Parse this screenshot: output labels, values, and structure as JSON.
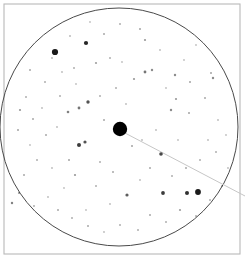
{
  "chart_data": {
    "type": "scatter",
    "title": "",
    "subtitle": "",
    "xlabel": "",
    "ylabel": "",
    "grid": false,
    "legend": "none",
    "xlim": [
      0,
      245
    ],
    "ylim": [
      0,
      258
    ],
    "frame": {
      "x": 4,
      "y": 4,
      "width": 236,
      "height": 250,
      "stroke": "#b9b9b9",
      "stroke_width": 1.1,
      "fill": "#ffffff"
    },
    "field_circle": {
      "label": "field-of-view circle",
      "cx": 119,
      "cy": 127,
      "r": 119,
      "stroke": "#4a4a4a",
      "stroke_width": 1.0,
      "fill": "none"
    },
    "target_marker": {
      "label": "target object",
      "cx": 120,
      "cy": 129,
      "r": 7.2,
      "fill": "#000000"
    },
    "pointer_line": {
      "label": "offset pointer",
      "x1": 125,
      "y1": 133,
      "x2": 245,
      "y2": 196,
      "stroke": "#c6c6c6",
      "stroke_width": 1.0
    },
    "star_color": "#1a1a1a",
    "stars": [
      {
        "x": 55,
        "y": 52,
        "r": 3.1,
        "o": 1.0
      },
      {
        "x": 86,
        "y": 43,
        "r": 2.1,
        "o": 0.95
      },
      {
        "x": 198,
        "y": 192,
        "r": 2.9,
        "o": 1.0
      },
      {
        "x": 187,
        "y": 193,
        "r": 2.0,
        "o": 0.9
      },
      {
        "x": 163,
        "y": 193,
        "r": 1.9,
        "o": 0.85
      },
      {
        "x": 79,
        "y": 145,
        "r": 2.0,
        "o": 0.85
      },
      {
        "x": 85,
        "y": 142,
        "r": 1.6,
        "o": 0.75
      },
      {
        "x": 161,
        "y": 154,
        "r": 1.8,
        "o": 0.8
      },
      {
        "x": 127,
        "y": 195,
        "r": 1.6,
        "o": 0.7
      },
      {
        "x": 88,
        "y": 102,
        "r": 1.7,
        "o": 0.75
      },
      {
        "x": 79,
        "y": 108,
        "r": 1.4,
        "o": 0.6
      },
      {
        "x": 68,
        "y": 112,
        "r": 1.3,
        "o": 0.55
      },
      {
        "x": 145,
        "y": 72,
        "r": 1.4,
        "o": 0.6
      },
      {
        "x": 152,
        "y": 70,
        "r": 1.2,
        "o": 0.5
      },
      {
        "x": 134,
        "y": 79,
        "r": 1.1,
        "o": 0.45
      },
      {
        "x": 175,
        "y": 75,
        "r": 1.2,
        "o": 0.5
      },
      {
        "x": 190,
        "y": 82,
        "r": 1.0,
        "o": 0.4
      },
      {
        "x": 176,
        "y": 99,
        "r": 1.1,
        "o": 0.45
      },
      {
        "x": 171,
        "y": 110,
        "r": 1.2,
        "o": 0.5
      },
      {
        "x": 189,
        "y": 113,
        "r": 1.0,
        "o": 0.4
      },
      {
        "x": 205,
        "y": 98,
        "r": 1.0,
        "o": 0.38
      },
      {
        "x": 213,
        "y": 78,
        "r": 1.2,
        "o": 0.5
      },
      {
        "x": 211,
        "y": 73,
        "r": 1.0,
        "o": 0.4
      },
      {
        "x": 145,
        "y": 40,
        "r": 1.1,
        "o": 0.45
      },
      {
        "x": 140,
        "y": 29,
        "r": 1.0,
        "o": 0.4
      },
      {
        "x": 120,
        "y": 24,
        "r": 1.0,
        "o": 0.35
      },
      {
        "x": 104,
        "y": 34,
        "r": 1.0,
        "o": 0.38
      },
      {
        "x": 96,
        "y": 63,
        "r": 1.1,
        "o": 0.42
      },
      {
        "x": 110,
        "y": 58,
        "r": 1.0,
        "o": 0.35
      },
      {
        "x": 74,
        "y": 68,
        "r": 1.0,
        "o": 0.35
      },
      {
        "x": 62,
        "y": 72,
        "r": 0.9,
        "o": 0.3
      },
      {
        "x": 45,
        "y": 82,
        "r": 1.0,
        "o": 0.35
      },
      {
        "x": 30,
        "y": 70,
        "r": 1.0,
        "o": 0.38
      },
      {
        "x": 26,
        "y": 97,
        "r": 1.0,
        "o": 0.35
      },
      {
        "x": 20,
        "y": 110,
        "r": 1.1,
        "o": 0.45
      },
      {
        "x": 33,
        "y": 119,
        "r": 1.0,
        "o": 0.38
      },
      {
        "x": 18,
        "y": 130,
        "r": 1.0,
        "o": 0.4
      },
      {
        "x": 46,
        "y": 135,
        "r": 1.0,
        "o": 0.38
      },
      {
        "x": 57,
        "y": 127,
        "r": 0.9,
        "o": 0.3
      },
      {
        "x": 69,
        "y": 160,
        "r": 1.0,
        "o": 0.4
      },
      {
        "x": 75,
        "y": 175,
        "r": 1.1,
        "o": 0.45
      },
      {
        "x": 52,
        "y": 168,
        "r": 0.9,
        "o": 0.3
      },
      {
        "x": 37,
        "y": 160,
        "r": 1.0,
        "o": 0.35
      },
      {
        "x": 24,
        "y": 175,
        "r": 1.0,
        "o": 0.38
      },
      {
        "x": 19,
        "y": 193,
        "r": 1.1,
        "o": 0.45
      },
      {
        "x": 12,
        "y": 203,
        "r": 1.2,
        "o": 0.55
      },
      {
        "x": 34,
        "y": 206,
        "r": 1.0,
        "o": 0.35
      },
      {
        "x": 48,
        "y": 197,
        "r": 0.9,
        "o": 0.3
      },
      {
        "x": 58,
        "y": 210,
        "r": 1.0,
        "o": 0.38
      },
      {
        "x": 72,
        "y": 218,
        "r": 1.0,
        "o": 0.35
      },
      {
        "x": 88,
        "y": 226,
        "r": 1.0,
        "o": 0.38
      },
      {
        "x": 104,
        "y": 232,
        "r": 0.9,
        "o": 0.3
      },
      {
        "x": 120,
        "y": 225,
        "r": 1.0,
        "o": 0.35
      },
      {
        "x": 138,
        "y": 230,
        "r": 1.0,
        "o": 0.35
      },
      {
        "x": 150,
        "y": 215,
        "r": 1.0,
        "o": 0.38
      },
      {
        "x": 166,
        "y": 222,
        "r": 1.0,
        "o": 0.35
      },
      {
        "x": 180,
        "y": 210,
        "r": 1.1,
        "o": 0.42
      },
      {
        "x": 196,
        "y": 216,
        "r": 1.0,
        "o": 0.35
      },
      {
        "x": 210,
        "y": 200,
        "r": 1.0,
        "o": 0.35
      },
      {
        "x": 222,
        "y": 186,
        "r": 1.0,
        "o": 0.35
      },
      {
        "x": 228,
        "y": 168,
        "r": 0.9,
        "o": 0.3
      },
      {
        "x": 216,
        "y": 152,
        "r": 1.0,
        "o": 0.35
      },
      {
        "x": 200,
        "y": 160,
        "r": 1.0,
        "o": 0.35
      },
      {
        "x": 186,
        "y": 168,
        "r": 1.0,
        "o": 0.38
      },
      {
        "x": 172,
        "y": 176,
        "r": 1.0,
        "o": 0.35
      },
      {
        "x": 150,
        "y": 168,
        "r": 1.0,
        "o": 0.38
      },
      {
        "x": 140,
        "y": 180,
        "r": 0.9,
        "o": 0.3
      },
      {
        "x": 113,
        "y": 172,
        "r": 1.0,
        "o": 0.38
      },
      {
        "x": 100,
        "y": 162,
        "r": 1.0,
        "o": 0.35
      },
      {
        "x": 96,
        "y": 186,
        "r": 1.0,
        "o": 0.35
      },
      {
        "x": 110,
        "y": 204,
        "r": 0.9,
        "o": 0.3
      },
      {
        "x": 132,
        "y": 146,
        "r": 1.0,
        "o": 0.4
      },
      {
        "x": 142,
        "y": 140,
        "r": 0.9,
        "o": 0.3
      },
      {
        "x": 104,
        "y": 120,
        "r": 1.0,
        "o": 0.38
      },
      {
        "x": 100,
        "y": 96,
        "r": 1.0,
        "o": 0.35
      },
      {
        "x": 116,
        "y": 88,
        "r": 1.0,
        "o": 0.35
      },
      {
        "x": 126,
        "y": 104,
        "r": 0.9,
        "o": 0.3
      },
      {
        "x": 60,
        "y": 96,
        "r": 1.0,
        "o": 0.35
      },
      {
        "x": 42,
        "y": 108,
        "r": 0.9,
        "o": 0.3
      },
      {
        "x": 52,
        "y": 58,
        "r": 1.0,
        "o": 0.3
      },
      {
        "x": 70,
        "y": 36,
        "r": 1.0,
        "o": 0.3
      },
      {
        "x": 90,
        "y": 22,
        "r": 0.9,
        "o": 0.28
      },
      {
        "x": 160,
        "y": 50,
        "r": 0.9,
        "o": 0.3
      },
      {
        "x": 184,
        "y": 60,
        "r": 0.9,
        "o": 0.28
      },
      {
        "x": 196,
        "y": 45,
        "r": 0.9,
        "o": 0.28
      },
      {
        "x": 218,
        "y": 120,
        "r": 0.9,
        "o": 0.3
      },
      {
        "x": 226,
        "y": 135,
        "r": 0.9,
        "o": 0.28
      },
      {
        "x": 208,
        "y": 140,
        "r": 0.9,
        "o": 0.3
      },
      {
        "x": 30,
        "y": 145,
        "r": 0.9,
        "o": 0.28
      },
      {
        "x": 64,
        "y": 188,
        "r": 0.9,
        "o": 0.28
      },
      {
        "x": 86,
        "y": 210,
        "r": 0.9,
        "o": 0.28
      },
      {
        "x": 156,
        "y": 130,
        "r": 0.9,
        "o": 0.3
      },
      {
        "x": 178,
        "y": 140,
        "r": 0.9,
        "o": 0.28
      },
      {
        "x": 122,
        "y": 62,
        "r": 0.9,
        "o": 0.28
      },
      {
        "x": 76,
        "y": 84,
        "r": 0.9,
        "o": 0.28
      },
      {
        "x": 166,
        "y": 88,
        "r": 0.9,
        "o": 0.28
      }
    ]
  }
}
